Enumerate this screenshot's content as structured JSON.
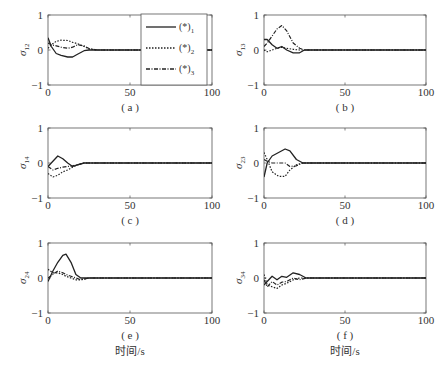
{
  "figure": {
    "xlabel_bottom": "时间/s",
    "caption": ""
  },
  "chart_data": [
    {
      "type": "line",
      "panel": "(a)",
      "ylabel": "σ12",
      "ylabel_base": "σ",
      "ylabel_sub": "12",
      "xlim": [
        0,
        100
      ],
      "ylim": [
        -1,
        1
      ],
      "xticks": [
        "0",
        "50",
        "100"
      ],
      "yticks": [
        "-1",
        "0",
        "1"
      ],
      "grid": false,
      "legend": {
        "position": "upper right (inside)",
        "entries": [
          "(*)1",
          "(*)2",
          "(*)3"
        ]
      },
      "series": [
        {
          "name": "(*)1",
          "style": "solid",
          "x": [
            0,
            2,
            5,
            8,
            12,
            15,
            18,
            22,
            25,
            30,
            100
          ],
          "y": [
            0.35,
            0.1,
            -0.1,
            -0.15,
            -0.2,
            -0.2,
            -0.12,
            -0.02,
            0.0,
            0.0,
            0.0
          ]
        },
        {
          "name": "(*)2",
          "style": "dotted",
          "x": [
            0,
            2,
            5,
            8,
            12,
            15,
            18,
            22,
            25,
            30,
            100
          ],
          "y": [
            0.05,
            0.15,
            0.25,
            0.28,
            0.27,
            0.22,
            0.18,
            0.1,
            0.03,
            0.0,
            0.0
          ]
        },
        {
          "name": "(*)3",
          "style": "dashdot",
          "x": [
            0,
            2,
            5,
            8,
            12,
            15,
            18,
            22,
            25,
            30,
            100
          ],
          "y": [
            0.2,
            0.15,
            0.12,
            0.08,
            0.05,
            0.08,
            0.15,
            0.12,
            0.04,
            0.0,
            0.0
          ]
        }
      ]
    },
    {
      "type": "line",
      "panel": "(b)",
      "ylabel": "σ13",
      "ylabel_base": "σ",
      "ylabel_sub": "13",
      "xlim": [
        0,
        100
      ],
      "ylim": [
        -1,
        1
      ],
      "xticks": [
        "0",
        "50",
        "100"
      ],
      "yticks": [
        "-1",
        "0",
        "1"
      ],
      "grid": false,
      "series": [
        {
          "name": "(*)1",
          "style": "solid",
          "x": [
            0,
            2,
            5,
            8,
            11,
            14,
            18,
            22,
            25,
            30,
            100
          ],
          "y": [
            0.3,
            0.3,
            0.15,
            0.05,
            0.1,
            0.0,
            -0.08,
            -0.08,
            0.0,
            0.0,
            0.0
          ]
        },
        {
          "name": "(*)2",
          "style": "dotted",
          "x": [
            0,
            2,
            5,
            8,
            11,
            14,
            18,
            22,
            25,
            30,
            100
          ],
          "y": [
            0.0,
            -0.05,
            0.0,
            0.05,
            0.08,
            0.05,
            0.02,
            0.0,
            0.0,
            0.0,
            0.0
          ]
        },
        {
          "name": "(*)3",
          "style": "dashdot",
          "x": [
            0,
            2,
            5,
            8,
            11,
            14,
            18,
            22,
            25,
            30,
            100
          ],
          "y": [
            0.1,
            0.2,
            0.4,
            0.6,
            0.7,
            0.55,
            0.2,
            0.05,
            0.0,
            0.0,
            0.0
          ]
        }
      ]
    },
    {
      "type": "line",
      "panel": "(c)",
      "ylabel": "σ14",
      "ylabel_base": "σ",
      "ylabel_sub": "14",
      "xlim": [
        0,
        100
      ],
      "ylim": [
        -1,
        1
      ],
      "xticks": [
        "0",
        "50",
        "100"
      ],
      "yticks": [
        "-1",
        "0",
        "1"
      ],
      "grid": false,
      "series": [
        {
          "name": "(*)1",
          "style": "solid",
          "x": [
            0,
            3,
            6,
            9,
            12,
            15,
            18,
            22,
            25,
            100
          ],
          "y": [
            -0.1,
            0.05,
            0.2,
            0.12,
            0.0,
            -0.1,
            -0.05,
            0.0,
            0.0,
            0.0
          ]
        },
        {
          "name": "(*)2",
          "style": "dotted",
          "x": [
            0,
            3,
            6,
            9,
            12,
            15,
            18,
            22,
            25,
            100
          ],
          "y": [
            -0.3,
            -0.4,
            -0.35,
            -0.25,
            -0.2,
            -0.12,
            -0.05,
            0.0,
            0.0,
            0.0
          ]
        },
        {
          "name": "(*)3",
          "style": "dashdot",
          "x": [
            0,
            3,
            6,
            9,
            12,
            15,
            18,
            22,
            25,
            100
          ],
          "y": [
            -0.1,
            -0.2,
            -0.15,
            -0.12,
            -0.1,
            -0.08,
            -0.05,
            0.0,
            0.0,
            0.0
          ]
        }
      ]
    },
    {
      "type": "line",
      "panel": "(d)",
      "ylabel": "σ23",
      "ylabel_base": "σ",
      "ylabel_sub": "23",
      "xlim": [
        0,
        100
      ],
      "ylim": [
        -1,
        1
      ],
      "xticks": [
        "0",
        "50",
        "100"
      ],
      "yticks": [
        "-1",
        "0",
        "1"
      ],
      "grid": false,
      "series": [
        {
          "name": "(*)1",
          "style": "solid",
          "x": [
            0,
            2,
            5,
            9,
            13,
            16,
            20,
            24,
            28,
            100
          ],
          "y": [
            -0.4,
            0.0,
            0.2,
            0.3,
            0.4,
            0.35,
            0.1,
            0.0,
            0.0,
            0.0
          ]
        },
        {
          "name": "(*)2",
          "style": "dotted",
          "x": [
            0,
            2,
            5,
            9,
            13,
            16,
            20,
            24,
            28,
            100
          ],
          "y": [
            0.3,
            0.1,
            -0.25,
            -0.38,
            -0.38,
            -0.2,
            -0.05,
            0.0,
            0.0,
            0.0
          ]
        },
        {
          "name": "(*)3",
          "style": "dashdot",
          "x": [
            0,
            2,
            5,
            9,
            13,
            16,
            20,
            24,
            28,
            100
          ],
          "y": [
            0.1,
            0.05,
            0.0,
            0.0,
            0.0,
            -0.1,
            -0.08,
            0.0,
            0.0,
            0.0
          ]
        }
      ]
    },
    {
      "type": "line",
      "panel": "(e)",
      "ylabel": "σ24",
      "ylabel_base": "σ",
      "ylabel_sub": "24",
      "xlim": [
        0,
        100
      ],
      "ylim": [
        -1,
        1
      ],
      "xticks": [
        "0",
        "50",
        "100"
      ],
      "yticks": [
        "-1",
        "0",
        "1"
      ],
      "grid": false,
      "series": [
        {
          "name": "(*)1",
          "style": "solid",
          "x": [
            0,
            3,
            6,
            9,
            11,
            14,
            17,
            20,
            25,
            100
          ],
          "y": [
            -0.1,
            0.2,
            0.45,
            0.65,
            0.68,
            0.45,
            0.1,
            0.0,
            0.0,
            0.0
          ]
        },
        {
          "name": "(*)2",
          "style": "dotted",
          "x": [
            0,
            3,
            6,
            9,
            11,
            14,
            17,
            20,
            25,
            100
          ],
          "y": [
            0.25,
            0.15,
            0.15,
            0.1,
            0.05,
            0.0,
            -0.05,
            -0.05,
            0.0,
            0.0
          ]
        },
        {
          "name": "(*)3",
          "style": "dashdot",
          "x": [
            0,
            3,
            6,
            9,
            11,
            14,
            17,
            20,
            25,
            100
          ],
          "y": [
            0.0,
            0.1,
            0.2,
            0.15,
            0.1,
            0.05,
            0.0,
            -0.05,
            0.0,
            0.0
          ]
        }
      ]
    },
    {
      "type": "line",
      "panel": "(f)",
      "ylabel": "σ34",
      "ylabel_base": "σ",
      "ylabel_sub": "34",
      "xlim": [
        0,
        100
      ],
      "ylim": [
        -1,
        1
      ],
      "xticks": [
        "0",
        "50",
        "100"
      ],
      "yticks": [
        "-1",
        "0",
        "1"
      ],
      "grid": false,
      "series": [
        {
          "name": "(*)1",
          "style": "solid",
          "x": [
            0,
            2,
            5,
            8,
            11,
            14,
            18,
            22,
            26,
            30,
            100
          ],
          "y": [
            -0.2,
            -0.1,
            0.05,
            -0.05,
            0.05,
            0.02,
            0.15,
            0.1,
            0.0,
            0.0,
            0.0
          ]
        },
        {
          "name": "(*)2",
          "style": "dotted",
          "x": [
            0,
            2,
            5,
            8,
            11,
            14,
            18,
            22,
            26,
            30,
            100
          ],
          "y": [
            0.1,
            -0.2,
            -0.25,
            -0.3,
            -0.2,
            -0.15,
            -0.05,
            0.0,
            0.0,
            0.0,
            0.0
          ]
        },
        {
          "name": "(*)3",
          "style": "dashdot",
          "x": [
            0,
            2,
            5,
            8,
            11,
            14,
            18,
            22,
            26,
            30,
            100
          ],
          "y": [
            -0.05,
            -0.25,
            -0.1,
            -0.2,
            -0.12,
            -0.1,
            0.0,
            -0.05,
            0.0,
            0.0,
            0.0
          ]
        }
      ]
    }
  ],
  "layout": {
    "panels": [
      {
        "x0": 48,
        "y0": 15,
        "w": 164,
        "h": 70
      },
      {
        "x0": 264,
        "y0": 15,
        "w": 162,
        "h": 70
      },
      {
        "x0": 48,
        "y0": 128,
        "w": 164,
        "h": 70
      },
      {
        "x0": 264,
        "y0": 128,
        "w": 162,
        "h": 70
      },
      {
        "x0": 48,
        "y0": 243,
        "w": 164,
        "h": 70
      },
      {
        "x0": 264,
        "y0": 243,
        "w": 162,
        "h": 70
      }
    ],
    "line_color": "#222222",
    "axis_color": "#555555"
  }
}
